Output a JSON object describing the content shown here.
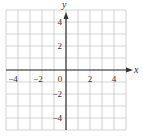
{
  "chart_data": {
    "type": "scatter",
    "title": "",
    "xlabel": "x",
    "ylabel": "y",
    "xlim": [
      -5,
      5
    ],
    "ylim": [
      -5,
      5
    ],
    "grid": true,
    "grid_step": 1,
    "x_ticks": [
      -4,
      -2,
      0,
      2,
      4
    ],
    "y_ticks": [
      4,
      2,
      -2,
      -4
    ],
    "x_tick_labels": [
      "−4",
      "−2",
      "0",
      "2",
      "4"
    ],
    "y_tick_labels": [
      "4",
      "2",
      "−2",
      "−4"
    ],
    "series": [],
    "legend": null
  },
  "colors": {
    "grid": "#c8c8c8",
    "axis": "#333333",
    "text": "#333333"
  }
}
